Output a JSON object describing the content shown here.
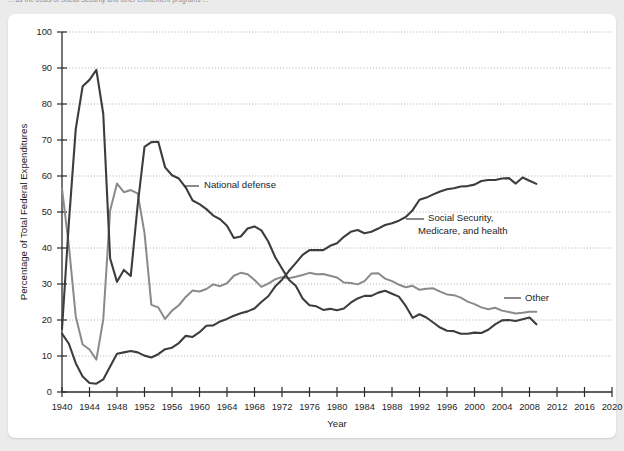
{
  "caption": {
    "text": "... as the costs of Social Security and other entitlement programs ..."
  },
  "chart_data": {
    "type": "line",
    "title": "",
    "xlabel": "Year",
    "ylabel": "Percentage of Total Federal Expenditures",
    "xlim": [
      1940,
      2020
    ],
    "ylim": [
      0,
      100
    ],
    "grid": true,
    "legend_position": "inline-annotations",
    "x_ticks": [
      1940,
      1944,
      1948,
      1952,
      1956,
      1960,
      1964,
      1968,
      1972,
      1976,
      1980,
      1984,
      1988,
      1992,
      1996,
      2000,
      2004,
      2008,
      2012,
      2016,
      2020
    ],
    "y_ticks": [
      0,
      10,
      20,
      30,
      40,
      50,
      60,
      70,
      80,
      90,
      100
    ],
    "colors": {
      "national_defense": "#3d3d3d",
      "social_security": "#3d3d3d",
      "other": "#8a8a8a"
    },
    "x": [
      1940,
      1941,
      1942,
      1943,
      1944,
      1945,
      1946,
      1947,
      1948,
      1949,
      1950,
      1951,
      1952,
      1953,
      1954,
      1955,
      1956,
      1957,
      1958,
      1959,
      1960,
      1961,
      1962,
      1963,
      1964,
      1965,
      1966,
      1967,
      1968,
      1969,
      1970,
      1971,
      1972,
      1973,
      1974,
      1975,
      1976,
      1977,
      1978,
      1979,
      1980,
      1981,
      1982,
      1983,
      1984,
      1985,
      1986,
      1987,
      1988,
      1989,
      1990,
      1991,
      1992,
      1993,
      1994,
      1995,
      1996,
      1997,
      1998,
      1999,
      2000,
      2001,
      2002,
      2003,
      2004,
      2005,
      2006,
      2007,
      2008,
      2009
    ],
    "series": [
      {
        "name": "National defense",
        "label_lines": [
          "National defense"
        ],
        "color": "#3d3d3d",
        "values": [
          17.5,
          47.1,
          73.0,
          84.9,
          86.7,
          89.5,
          77.3,
          37.1,
          30.6,
          33.9,
          32.2,
          51.8,
          68.1,
          69.4,
          69.5,
          62.4,
          60.2,
          59.3,
          56.8,
          53.2,
          52.2,
          50.8,
          49.0,
          48.0,
          46.2,
          42.8,
          43.2,
          45.4,
          46.0,
          44.9,
          41.8,
          37.5,
          34.3,
          31.2,
          29.5,
          26.0,
          24.1,
          23.8,
          22.8,
          23.1,
          22.7,
          23.2,
          24.8,
          26.0,
          26.7,
          26.7,
          27.6,
          28.1,
          27.3,
          26.5,
          23.9,
          20.6,
          21.6,
          20.7,
          19.3,
          17.9,
          17.0,
          16.9,
          16.2,
          16.2,
          16.5,
          16.4,
          17.3,
          18.8,
          19.9,
          20.0,
          19.7,
          20.2,
          20.7,
          18.8
        ]
      },
      {
        "name": "Social Security, Medicare, and health",
        "label_lines": [
          "Social Security,",
          "Medicare, and health"
        ],
        "color": "#3d3d3d",
        "values": [
          16.2,
          13.4,
          8.0,
          4.3,
          2.5,
          2.3,
          3.5,
          7.1,
          10.6,
          11.0,
          11.4,
          11.0,
          10.1,
          9.6,
          10.5,
          11.9,
          12.3,
          13.6,
          15.6,
          15.3,
          16.6,
          18.4,
          18.5,
          19.6,
          20.3,
          21.2,
          21.9,
          22.4,
          23.2,
          25.0,
          26.6,
          29.3,
          31.2,
          33.6,
          35.8,
          38.1,
          39.4,
          39.4,
          39.4,
          40.6,
          41.3,
          43.1,
          44.5,
          45.0,
          44.1,
          44.5,
          45.4,
          46.4,
          46.9,
          47.6,
          48.6,
          50.5,
          53.4,
          54.0,
          54.9,
          55.7,
          56.3,
          56.6,
          57.1,
          57.2,
          57.6,
          58.6,
          58.9,
          58.9,
          59.3,
          59.4,
          57.9,
          59.6,
          58.7,
          57.8
        ]
      },
      {
        "name": "Other",
        "label_lines": [
          "Other"
        ],
        "color": "#8a8a8a",
        "values": [
          56.5,
          40.6,
          21.0,
          13.2,
          11.8,
          9.0,
          20.1,
          50.4,
          57.9,
          55.5,
          56.1,
          55.2,
          44.2,
          24.2,
          23.5,
          20.3,
          22.6,
          24.1,
          26.4,
          28.2,
          27.9,
          28.6,
          29.9,
          29.4,
          30.2,
          32.3,
          33.1,
          32.7,
          31.1,
          29.2,
          30.1,
          31.3,
          31.9,
          31.6,
          32.0,
          32.5,
          33.1,
          32.7,
          32.8,
          32.3,
          31.8,
          30.4,
          30.3,
          29.9,
          30.8,
          32.9,
          33.0,
          31.5,
          30.8,
          29.8,
          29.1,
          29.5,
          28.4,
          28.7,
          28.8,
          27.9,
          27.1,
          26.9,
          26.2,
          25.1,
          24.4,
          23.5,
          23.0,
          23.4,
          22.6,
          22.2,
          21.8,
          22.0,
          22.3,
          22.3
        ]
      }
    ],
    "annotations": [
      {
        "name": "national-defense-label",
        "text_lines": [
          "National defense"
        ],
        "x_px": 204,
        "y_px": 188,
        "leader_from_px": [
          199,
          186
        ],
        "leader_to_px": [
          184,
          186
        ]
      },
      {
        "name": "social-security-label",
        "text_lines": [
          "Social Security,",
          "Medicare, and health"
        ],
        "x_px": 428,
        "y_px": 221,
        "leader_from_px": [
          424,
          219
        ],
        "leader_to_px": [
          406,
          219
        ]
      },
      {
        "name": "other-label",
        "text_lines": [
          "Other"
        ],
        "x_px": 525,
        "y_px": 301,
        "leader_from_px": [
          521,
          298
        ],
        "leader_to_px": [
          504,
          298
        ]
      }
    ]
  }
}
